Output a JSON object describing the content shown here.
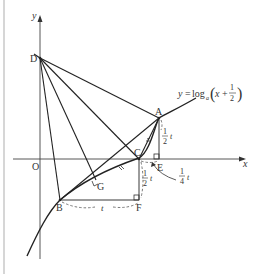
{
  "figure": {
    "axes": {
      "x_label": "x",
      "y_label": "y",
      "origin_label": "O"
    },
    "curve": {
      "equation_lhs": "y",
      "equation_eq": "=",
      "equation_func": "log",
      "equation_base": "a",
      "equation_arg_var": "x",
      "equation_plus": "+",
      "equation_frac_num": "1",
      "equation_frac_den": "2"
    },
    "points": {
      "A": "A",
      "B": "B",
      "C": "C",
      "D": "D",
      "E": "E",
      "F": "F",
      "G": "G"
    },
    "annotations": {
      "AE": {
        "num": "1",
        "den": "2",
        "var": "t"
      },
      "CF": {
        "num": "1",
        "den": "2",
        "var": "t"
      },
      "CE": {
        "num": "1",
        "den": "4",
        "var": "t"
      },
      "BF": {
        "var": "t"
      }
    },
    "colors": {
      "line": "#222222",
      "dashed": "#555555",
      "border": "#bbbbbb"
    }
  }
}
